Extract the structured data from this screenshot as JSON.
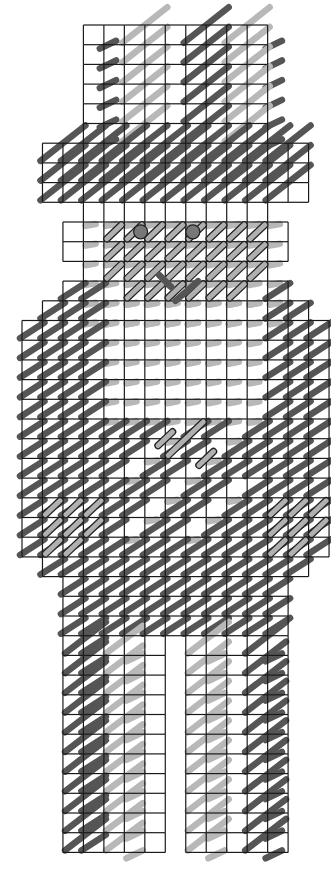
{
  "chart_data": {
    "type": "stitch-chart",
    "title": "",
    "description": "Plastic canvas / needlepoint stitch chart of a figure with hat, face, torso with hands, and two legs",
    "grid": {
      "origin_x": 22,
      "origin_y": 25,
      "cell_w": 20.47,
      "cell_h": 19.7,
      "columns": 15,
      "rows": 42
    },
    "colors": {
      "dark": "#555555",
      "light": "#b8b8b8",
      "outline_fill": "#b0b0b0",
      "knot": "#777777",
      "grid": "#1a1a1a"
    },
    "regions": [
      {
        "name": "hat-crown",
        "rows": [
          0,
          5
        ],
        "cols": [
          3,
          12
        ]
      },
      {
        "name": "hat-brim",
        "rows": [
          6,
          8
        ],
        "cols": [
          1,
          14
        ]
      },
      {
        "name": "neck-band",
        "rows": [
          9,
          9
        ],
        "cols": [
          3,
          12
        ]
      },
      {
        "name": "face",
        "rows": [
          10,
          11
        ],
        "cols": [
          2,
          13
        ]
      },
      {
        "name": "chin",
        "rows": [
          12,
          12
        ],
        "cols": [
          3,
          12
        ]
      },
      {
        "name": "shoulders-1",
        "rows": [
          13,
          13
        ],
        "cols": [
          2,
          13
        ]
      },
      {
        "name": "shoulders-2",
        "rows": [
          14,
          14
        ],
        "cols": [
          1,
          14
        ]
      },
      {
        "name": "torso",
        "rows": [
          15,
          26
        ],
        "cols": [
          0,
          15
        ]
      },
      {
        "name": "hips-1",
        "rows": [
          27,
          27
        ],
        "cols": [
          1,
          14
        ]
      },
      {
        "name": "hips-2",
        "rows": [
          28,
          30
        ],
        "cols": [
          2,
          13
        ]
      },
      {
        "name": "left-leg",
        "rows": [
          31,
          41
        ],
        "cols": [
          2,
          7
        ]
      },
      {
        "name": "right-leg",
        "rows": [
          31,
          41
        ],
        "cols": [
          8,
          13
        ]
      }
    ],
    "features": {
      "eyes": [
        {
          "col": 5.6,
          "row": 10.6
        },
        {
          "col": 8.15,
          "row": 10.6
        }
      ],
      "mouth_row": 13,
      "belly_detail": {
        "col": 7,
        "row": 21
      },
      "hands": [
        {
          "side": "left",
          "rows": [
            24,
            26
          ],
          "cols": [
            1,
            3
          ]
        },
        {
          "side": "right",
          "rows": [
            24,
            26
          ],
          "cols": [
            12,
            14
          ]
        }
      ]
    }
  }
}
